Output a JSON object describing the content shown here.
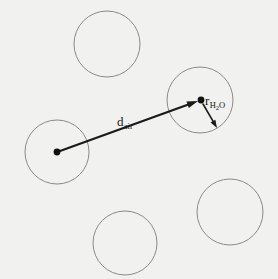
{
  "figure": {
    "name": "air-gap-water-droplet-schematic",
    "background_color": "#f1f1ef",
    "width": 278,
    "height": 279
  },
  "style": {
    "circle_stroke_color": "#8a8a8a",
    "circle_stroke_width": 1,
    "circle_fill": "none",
    "arrow_color": "#1a1a1a",
    "d_arrow_stroke_width": 2.2,
    "r_arrow_stroke_width": 1.6,
    "dot_color": "#111111",
    "dot_radius": 3.4,
    "text_color": "#161616"
  },
  "circles": [
    {
      "id": "circle-top-center",
      "cx": 107,
      "cy": 44,
      "r": 33,
      "has_center_dot": false
    },
    {
      "id": "circle-upper-right",
      "cx": 200,
      "cy": 100,
      "r": 33,
      "has_center_dot": true
    },
    {
      "id": "circle-left",
      "cx": 57,
      "cy": 152,
      "r": 32,
      "has_center_dot": true
    },
    {
      "id": "circle-bottom-right",
      "cx": 230,
      "cy": 212,
      "r": 33,
      "has_center_dot": false
    },
    {
      "id": "circle-bottom-center",
      "cx": 125,
      "cy": 243,
      "r": 32,
      "has_center_dot": false
    }
  ],
  "center_dots": [
    {
      "id": "dot-left-circle-center",
      "cx": 57,
      "cy": 152
    },
    {
      "id": "dot-upper-right-circle-center",
      "cx": 201,
      "cy": 100
    }
  ],
  "arrows": [
    {
      "id": "arrow-d-air",
      "x1": 60,
      "y1": 151,
      "x2": 198,
      "y2": 101,
      "head_length": 11,
      "head_width": 7
    },
    {
      "id": "arrow-r-h2o",
      "x1": 203,
      "y1": 104,
      "x2": 217,
      "y2": 128,
      "head_length": 8,
      "head_width": 5.5
    }
  ],
  "labels": {
    "d_air": {
      "base": "d",
      "subscript": "air",
      "plain": "d_air",
      "meaning": "center-to-center separation distance in air"
    },
    "r_h2o": {
      "base": "r",
      "subscript_prefix": "H",
      "subscript_number": "2",
      "subscript_suffix": "O",
      "plain": "r_H2O",
      "meaning": "radius of the water droplet"
    }
  }
}
